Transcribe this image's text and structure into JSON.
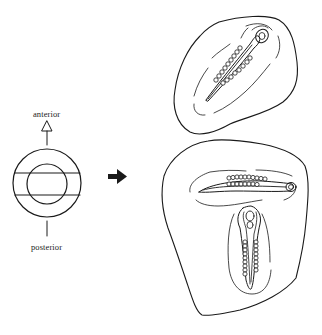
{
  "figure": {
    "orientation_labels": {
      "anterior": "anterior",
      "posterior": "posterior"
    },
    "colors": {
      "ink": "#1a1a1a",
      "background": "#ffffff"
    },
    "panels": [
      {
        "id": "schematic",
        "description": "Concentric circles with two horizontal chords, anterior arrow above, posterior line below"
      },
      {
        "id": "arrow",
        "description": "Solid right-pointing arrow"
      },
      {
        "id": "embryo-upper",
        "description": "Single diagonal embryo with somites on rounded egg fragment"
      },
      {
        "id": "embryo-lower",
        "description": "Two embryos (one horizontal, one vertical) forming a T on larger egg fragment"
      }
    ]
  }
}
